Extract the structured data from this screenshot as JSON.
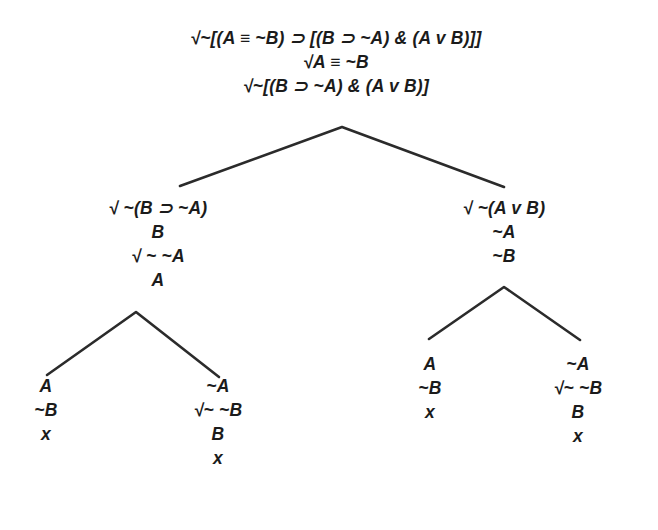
{
  "diagram": {
    "type": "semantic-tableau",
    "background_color": "#ffffff",
    "text_color": "#1b1b1b",
    "line_color": "#2b2b2b",
    "check_mark": "√",
    "closure_mark": "x"
  },
  "root": {
    "name": "root-trunk",
    "center_x": 336,
    "top": 26,
    "lines": [
      "√~[(A ≡ ~B) ⊃ [(B ⊃ ~A) & (A v B)]]",
      "√A ≡ ~B",
      "√~[(B ⊃ ~A) & (A v B)]"
    ]
  },
  "branches": {
    "left": {
      "name": "left-branch",
      "center_x": 158,
      "top": 196,
      "lines": [
        "√ ~(B ⊃ ~A)",
        "B",
        "√ ~ ~A",
        "A"
      ]
    },
    "right": {
      "name": "right-branch",
      "center_x": 504,
      "top": 196,
      "lines": [
        "√ ~(A v B)",
        "~A",
        "~B"
      ]
    }
  },
  "leaves": [
    {
      "name": "leaf-1",
      "center_x": 46,
      "top": 374,
      "lines": [
        "A",
        "~B",
        "x"
      ]
    },
    {
      "name": "leaf-2",
      "center_x": 218,
      "top": 374,
      "lines": [
        "~A",
        "√~ ~B",
        "B",
        "x"
      ]
    },
    {
      "name": "leaf-3",
      "center_x": 430,
      "top": 352,
      "lines": [
        "A",
        "~B",
        "x"
      ]
    },
    {
      "name": "leaf-4",
      "center_x": 578,
      "top": 352,
      "lines": [
        "~A",
        "√~ ~B",
        "B",
        "x"
      ]
    }
  ],
  "connectors": [
    {
      "name": "fork-root",
      "apex": [
        342,
        127
      ],
      "left_end": [
        180,
        186
      ],
      "right_end": [
        504,
        187
      ]
    },
    {
      "name": "fork-left",
      "apex": [
        136,
        312
      ],
      "left_end": [
        47,
        375
      ],
      "right_end": [
        219,
        377
      ]
    },
    {
      "name": "fork-right",
      "apex": [
        504,
        287
      ],
      "left_end": [
        429,
        339
      ],
      "right_end": [
        580,
        340
      ]
    }
  ]
}
